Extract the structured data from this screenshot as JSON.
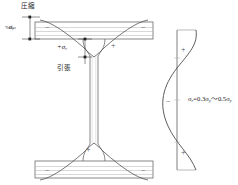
{
  "figure": {
    "title_top_left": "圧縮",
    "label_tension": "引張",
    "label_sigma_negative": "−σ",
    "label_sigma_negative_sub": "r",
    "label_sigma_positive": "+σ",
    "label_sigma_positive_sub": "r",
    "formula": {
      "lhs": "σ",
      "lhs_sub": "r",
      "eq": "=",
      "term1": "0.3σ",
      "term1_sub": "y",
      "range": "～",
      "term2": "0.5σ",
      "term2_sub": "y"
    },
    "signs": {
      "beam_top_left": "−",
      "beam_top_right": "−",
      "beam_mid_left": "+",
      "beam_mid_right": "+",
      "beam_bottom_center": "+",
      "beam_bottom_left": "−",
      "beam_bottom_right": "−",
      "profile_top": "+",
      "profile_middle": "−",
      "profile_bottom": "+"
    },
    "colors": {
      "outline": "#555555",
      "hatch": "#9a9a9a",
      "curve": "#4a4a4a",
      "axis": "#7d7d7d",
      "dimension": "#333333",
      "background": "#ffffff"
    }
  }
}
